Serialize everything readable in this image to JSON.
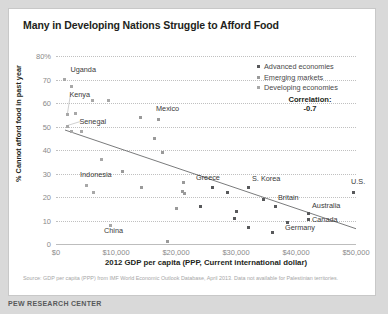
{
  "title": "Many in Developing Nations Struggle to Afford Food",
  "legend": {
    "position": "top-right",
    "items": [
      {
        "label": "Advanced economies",
        "color": "#58595b",
        "key": "adv"
      },
      {
        "label": "Emerging markets",
        "color": "#9a9a9a",
        "key": "eme"
      },
      {
        "label": "Developing economies",
        "color": "#a8a8a8",
        "key": "dev"
      }
    ]
  },
  "annotation": {
    "correlation_label": "Correlation:",
    "correlation_value": "-0.7"
  },
  "footer": {
    "source": "Source: GDP per capita (PPP) from IMF World Economic Outlook Database, April 2013. Data not available for Palestinian territories.",
    "brand": "PEW RESEARCH CENTER"
  },
  "chart_data": {
    "type": "scatter",
    "title": "Many in Developing Nations Struggle to Afford Food",
    "xlabel": "2012 GDP per capita (PPP, Current international dollar)",
    "ylabel": "% Cannot afford food in past year",
    "xlim": [
      0,
      50000
    ],
    "ylim": [
      0,
      80
    ],
    "grid": true,
    "xticks": [
      0,
      10000,
      20000,
      30000,
      40000,
      50000
    ],
    "xticklabels": [
      "$0",
      "$10,000",
      "$20,000",
      "$30,000",
      "$40,000",
      "$50,000"
    ],
    "yticks": [
      0,
      10,
      20,
      30,
      40,
      50,
      60,
      70,
      80
    ],
    "yticklabels": [
      "0",
      "10",
      "20",
      "30",
      "40",
      "50",
      "60",
      "70",
      "80%"
    ],
    "trendline": {
      "x0": 1500,
      "y0": 48.5,
      "x1": 50000,
      "y1": 6.5
    },
    "points": [
      {
        "x": 1400,
        "y": 70,
        "g": "dev",
        "label": "Uganda",
        "lx": 6,
        "ly": -11,
        "leader": false
      },
      {
        "x": 2600,
        "y": 67,
        "g": "dev",
        "label": "",
        "lx": 0,
        "ly": 0,
        "leader": false
      },
      {
        "x": 6000,
        "y": 61,
        "g": "dev",
        "label": "",
        "lx": 0,
        "ly": 0,
        "leader": false
      },
      {
        "x": 8700,
        "y": 61,
        "g": "dev",
        "label": "",
        "lx": 0,
        "ly": 0,
        "leader": false
      },
      {
        "x": 1900,
        "y": 55,
        "g": "dev",
        "label": "Kenya",
        "lx": 2,
        "ly": -21,
        "leader": true
      },
      {
        "x": 3300,
        "y": 55.5,
        "g": "dev",
        "label": "",
        "lx": 0,
        "ly": 0,
        "leader": false
      },
      {
        "x": 14000,
        "y": 54,
        "g": "eme",
        "label": "",
        "lx": 0,
        "ly": 0,
        "leader": false
      },
      {
        "x": 17000,
        "y": 53,
        "g": "eme",
        "label": "Mexico",
        "lx": -2,
        "ly": -11,
        "leader": false
      },
      {
        "x": 1900,
        "y": 50,
        "g": "dev",
        "label": "Senegal",
        "lx": 12,
        "ly": -6,
        "leader": true
      },
      {
        "x": 2600,
        "y": 48,
        "g": "dev",
        "label": "",
        "lx": 0,
        "ly": 0,
        "leader": false
      },
      {
        "x": 4300,
        "y": 48,
        "g": "dev",
        "label": "",
        "lx": 0,
        "ly": 0,
        "leader": false
      },
      {
        "x": 16400,
        "y": 45,
        "g": "eme",
        "label": "",
        "lx": 0,
        "ly": 0,
        "leader": false
      },
      {
        "x": 17800,
        "y": 39,
        "g": "eme",
        "label": "",
        "lx": 0,
        "ly": 0,
        "leader": false
      },
      {
        "x": 7500,
        "y": 36,
        "g": "dev",
        "label": "",
        "lx": 0,
        "ly": 0,
        "leader": false
      },
      {
        "x": 11000,
        "y": 31,
        "g": "eme",
        "label": "",
        "lx": 0,
        "ly": 0,
        "leader": false
      },
      {
        "x": 5000,
        "y": 25,
        "g": "dev",
        "label": "Indonesia",
        "lx": -6,
        "ly": -11,
        "leader": false
      },
      {
        "x": 6200,
        "y": 22,
        "g": "dev",
        "label": "",
        "lx": 0,
        "ly": 0,
        "leader": false
      },
      {
        "x": 14200,
        "y": 24,
        "g": "eme",
        "label": "",
        "lx": 0,
        "ly": 0,
        "leader": false
      },
      {
        "x": 21200,
        "y": 26,
        "g": "eme",
        "label": "",
        "lx": 0,
        "ly": 0,
        "leader": false
      },
      {
        "x": 21000,
        "y": 22.5,
        "g": "eme",
        "label": "",
        "lx": 0,
        "ly": 0,
        "leader": false
      },
      {
        "x": 21400,
        "y": 21.5,
        "g": "eme",
        "label": "",
        "lx": 0,
        "ly": 0,
        "leader": false
      },
      {
        "x": 20000,
        "y": 15,
        "g": "eme",
        "label": "",
        "lx": 0,
        "ly": 0,
        "leader": false
      },
      {
        "x": 24000,
        "y": 16,
        "g": "adv",
        "label": "",
        "lx": 0,
        "ly": 0,
        "leader": false
      },
      {
        "x": 9000,
        "y": 8,
        "g": "dev",
        "label": "China",
        "lx": -6,
        "ly": 5,
        "leader": false
      },
      {
        "x": 18500,
        "y": 1,
        "g": "eme",
        "label": "",
        "lx": 0,
        "ly": 0,
        "leader": false
      },
      {
        "x": 26000,
        "y": 24,
        "g": "adv",
        "label": "Greece",
        "lx": -16,
        "ly": -11,
        "leader": false
      },
      {
        "x": 28600,
        "y": 22,
        "g": "adv",
        "label": "",
        "lx": 0,
        "ly": 0,
        "leader": false
      },
      {
        "x": 32000,
        "y": 24,
        "g": "adv",
        "label": "S. Korea",
        "lx": 4,
        "ly": -10,
        "leader": false
      },
      {
        "x": 34600,
        "y": 19,
        "g": "adv",
        "label": "",
        "lx": 0,
        "ly": 0,
        "leader": false
      },
      {
        "x": 36500,
        "y": 16,
        "g": "adv",
        "label": "Britain",
        "lx": 3,
        "ly": -9,
        "leader": false
      },
      {
        "x": 30000,
        "y": 14,
        "g": "adv",
        "label": "",
        "lx": 0,
        "ly": 0,
        "leader": false
      },
      {
        "x": 29700,
        "y": 11,
        "g": "adv",
        "label": "",
        "lx": 0,
        "ly": 0,
        "leader": false
      },
      {
        "x": 42000,
        "y": 13,
        "g": "adv",
        "label": "Australia",
        "lx": 4,
        "ly": -8,
        "leader": false
      },
      {
        "x": 42000,
        "y": 10.5,
        "g": "adv",
        "label": "Canada",
        "lx": 4,
        "ly": 0,
        "leader": false
      },
      {
        "x": 38500,
        "y": 9,
        "g": "adv",
        "label": "Germany",
        "lx": -2,
        "ly": 4,
        "leader": false
      },
      {
        "x": 32000,
        "y": 7,
        "g": "adv",
        "label": "",
        "lx": 0,
        "ly": 0,
        "leader": false
      },
      {
        "x": 36000,
        "y": 5,
        "g": "adv",
        "label": "",
        "lx": 0,
        "ly": 0,
        "leader": false
      },
      {
        "x": 49500,
        "y": 22,
        "g": "adv",
        "label": "U.S.",
        "lx": -2,
        "ly": -11,
        "leader": false
      }
    ]
  }
}
